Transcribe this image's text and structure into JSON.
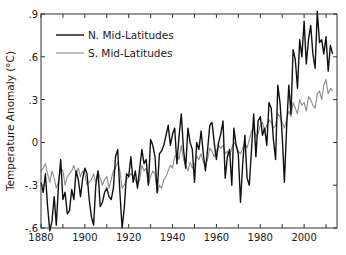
{
  "chart_data": {
    "type": "line",
    "title": "",
    "xlabel": "",
    "ylabel": "Temperature Anomaly (°C)",
    "xlim": [
      1880,
      2015
    ],
    "ylim": [
      -0.6,
      0.9
    ],
    "x_ticks": [
      1880,
      1900,
      1920,
      1940,
      1960,
      1980,
      2000
    ],
    "x_tick_labels": [
      "1880",
      "1900",
      "1920",
      "1940",
      "1960",
      "1980",
      "2000"
    ],
    "y_ticks": [
      0.9,
      0.6,
      0.3,
      0,
      -0.3,
      -0.6
    ],
    "y_tick_labels": [
      ".9",
      ".6",
      ".3",
      "0",
      "-.3",
      "-.6"
    ],
    "grid": false,
    "legend_position": "upper left",
    "x_start": 1880,
    "series": [
      {
        "name": "N. Mid-Latitudes",
        "color": "#111111",
        "width": 1.4,
        "values": [
          -0.28,
          -0.35,
          -0.22,
          -0.45,
          -0.62,
          -0.55,
          -0.38,
          -0.58,
          -0.3,
          -0.12,
          -0.4,
          -0.35,
          -0.5,
          -0.48,
          -0.33,
          -0.4,
          -0.2,
          -0.26,
          -0.38,
          -0.25,
          -0.18,
          -0.22,
          -0.4,
          -0.52,
          -0.58,
          -0.3,
          -0.2,
          -0.45,
          -0.42,
          -0.35,
          -0.32,
          -0.38,
          -0.4,
          -0.32,
          -0.1,
          -0.05,
          -0.35,
          -0.6,
          -0.46,
          -0.22,
          -0.24,
          -0.1,
          -0.28,
          -0.2,
          -0.32,
          -0.18,
          -0.05,
          -0.15,
          -0.12,
          -0.3,
          0.02,
          -0.02,
          -0.1,
          -0.35,
          -0.08,
          -0.06,
          -0.02,
          0.05,
          0.12,
          -0.02,
          0.06,
          0.1,
          -0.15,
          0.05,
          0.2,
          -0.05,
          -0.18,
          0.1,
          0.0,
          -0.05,
          -0.28,
          0.0,
          -0.05,
          0.08,
          -0.08,
          -0.2,
          -0.05,
          0.12,
          0.14,
          0.0,
          -0.12,
          0.0,
          0.06,
          0.15,
          -0.25,
          -0.1,
          -0.05,
          -0.3,
          0.1,
          -0.02,
          -0.08,
          -0.42,
          -0.15,
          0.05,
          -0.25,
          -0.3,
          -0.05,
          0.2,
          -0.1,
          0.15,
          0.18,
          0.05,
          0.1,
          -0.02,
          0.28,
          0.24,
          0.02,
          -0.12,
          0.4,
          0.28,
          0.05,
          -0.28,
          0.1,
          0.4,
          0.2,
          0.65,
          0.58,
          0.38,
          0.72,
          0.6,
          0.85,
          0.55,
          0.72,
          0.82,
          0.62,
          0.52,
          0.92,
          0.7,
          0.72,
          0.62,
          0.74,
          0.5,
          0.68,
          0.62
        ]
      },
      {
        "name": "S. Mid-Latitudes",
        "color": "#8c8c8c",
        "width": 1.1,
        "values": [
          -0.2,
          -0.18,
          -0.15,
          -0.22,
          -0.28,
          -0.2,
          -0.25,
          -0.32,
          -0.28,
          -0.18,
          -0.2,
          -0.3,
          -0.24,
          -0.22,
          -0.2,
          -0.16,
          -0.22,
          -0.18,
          -0.24,
          -0.2,
          -0.22,
          -0.3,
          -0.28,
          -0.26,
          -0.22,
          -0.28,
          -0.2,
          -0.25,
          -0.3,
          -0.26,
          -0.24,
          -0.32,
          -0.26,
          -0.2,
          -0.18,
          -0.14,
          -0.2,
          -0.32,
          -0.3,
          -0.26,
          -0.24,
          -0.22,
          -0.24,
          -0.26,
          -0.3,
          -0.26,
          -0.16,
          -0.2,
          -0.18,
          -0.3,
          -0.24,
          -0.2,
          -0.22,
          -0.36,
          -0.3,
          -0.32,
          -0.26,
          -0.24,
          -0.2,
          -0.16,
          -0.18,
          -0.1,
          -0.08,
          -0.12,
          -0.02,
          -0.12,
          -0.16,
          -0.2,
          -0.14,
          -0.18,
          -0.16,
          -0.1,
          -0.12,
          -0.08,
          -0.14,
          -0.16,
          -0.12,
          -0.04,
          -0.06,
          -0.1,
          -0.06,
          -0.02,
          -0.04,
          -0.02,
          -0.08,
          -0.06,
          -0.1,
          -0.04,
          0.0,
          -0.02,
          -0.06,
          -0.08,
          -0.04,
          0.0,
          -0.04,
          0.02,
          0.08,
          0.1,
          0.04,
          0.06,
          0.12,
          0.14,
          0.08,
          0.12,
          0.16,
          0.14,
          0.1,
          0.12,
          0.2,
          0.18,
          0.14,
          0.1,
          0.16,
          0.22,
          0.18,
          0.28,
          0.24,
          0.2,
          0.3,
          0.26,
          0.28,
          0.22,
          0.32,
          0.3,
          0.26,
          0.24,
          0.34,
          0.36,
          0.3,
          0.4,
          0.44,
          0.34,
          0.38,
          0.36
        ]
      }
    ]
  }
}
